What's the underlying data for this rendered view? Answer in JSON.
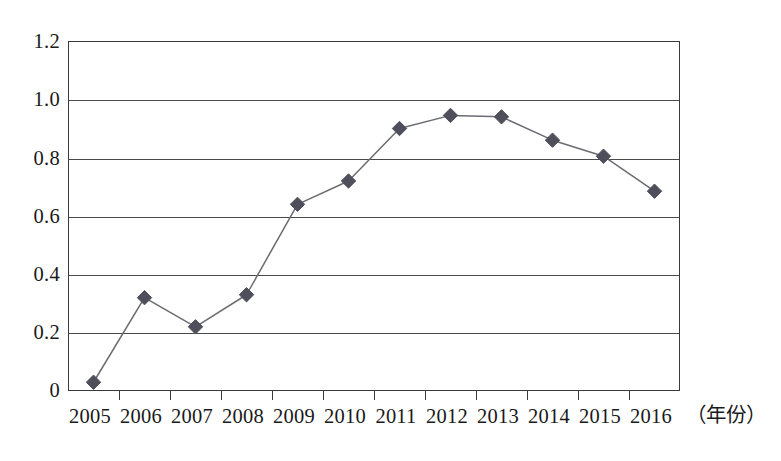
{
  "chart_data": {
    "type": "line",
    "title": "",
    "subtitle": "",
    "xlabel": "（年份）",
    "ylabel": "",
    "categories": [
      "2005",
      "2006",
      "2007",
      "2008",
      "2009",
      "2010",
      "2011",
      "2012",
      "2013",
      "2014",
      "2015",
      "2016"
    ],
    "values": [
      0.03,
      0.32,
      0.22,
      0.33,
      0.64,
      0.72,
      0.9,
      0.945,
      0.94,
      0.86,
      0.805,
      0.685
    ],
    "series": [
      {
        "name": "series-1",
        "values": [
          0.03,
          0.32,
          0.22,
          0.33,
          0.64,
          0.72,
          0.9,
          0.945,
          0.94,
          0.86,
          0.805,
          0.685
        ]
      }
    ],
    "ylim": [
      0,
      1.2
    ],
    "yticks": [
      "0",
      "0.2",
      "0.4",
      "0.6",
      "0.8",
      "1.0",
      "1.2"
    ],
    "ytick_values": [
      0,
      0.2,
      0.4,
      0.6,
      0.8,
      1.0,
      1.2
    ],
    "grid": true,
    "grid_axis": "y",
    "legend": false,
    "legend_position": "none",
    "marker": "diamond",
    "marker_color": "#4f4f5c",
    "line_color": "#6b6b72",
    "axis_color": "#3b3b3b",
    "background": "#ffffff"
  }
}
